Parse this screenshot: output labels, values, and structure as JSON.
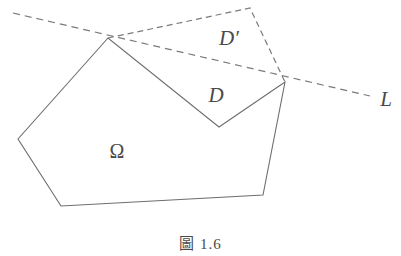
{
  "figure": {
    "caption_label": "圖",
    "caption_number": "1.6",
    "caption_full": "圖 1.6",
    "colors": {
      "solid_stroke": "#6e6e72",
      "dashed_stroke": "#7a7a7e",
      "text": "#4a4a4a",
      "background": "#ffffff"
    },
    "labels": {
      "omega": "Ω",
      "d": "D",
      "d_prime": "D′",
      "line": "L"
    },
    "label_positions": {
      "omega": {
        "x": 117,
        "y": 151
      },
      "d": {
        "x": 216,
        "y": 95
      },
      "d_prime": {
        "x": 229,
        "y": 38
      },
      "line": {
        "x": 386,
        "y": 99
      }
    },
    "geometry": {
      "omega_outline": [
        {
          "x": 108,
          "y": 38
        },
        {
          "x": 18,
          "y": 139
        },
        {
          "x": 61,
          "y": 206
        },
        {
          "x": 263,
          "y": 195
        },
        {
          "x": 285,
          "y": 82
        },
        {
          "x": 219,
          "y": 127
        }
      ],
      "chord": [
        {
          "x": 108,
          "y": 38
        },
        {
          "x": 285,
          "y": 82
        }
      ],
      "d_region": [
        {
          "x": 108,
          "y": 38
        },
        {
          "x": 285,
          "y": 82
        },
        {
          "x": 219,
          "y": 127
        }
      ],
      "d_prime_region": [
        {
          "x": 108,
          "y": 38
        },
        {
          "x": 250,
          "y": 8
        },
        {
          "x": 285,
          "y": 82
        }
      ],
      "line_L": [
        {
          "x": 13,
          "y": 13
        },
        {
          "x": 370,
          "y": 96
        }
      ]
    },
    "stroke_widths": {
      "solid": 1.1,
      "dashed": 1.2
    },
    "dash_patterns": {
      "line_L": "7 5",
      "d_prime": "6 4"
    }
  }
}
